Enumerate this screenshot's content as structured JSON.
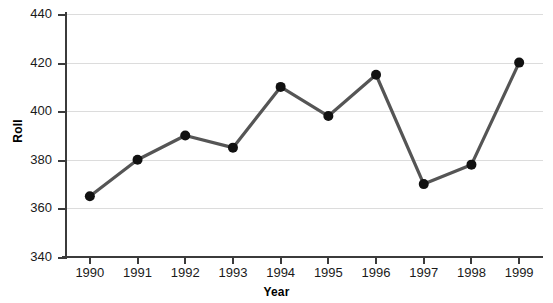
{
  "chart_data": {
    "type": "line",
    "title": "",
    "xlabel": "Year",
    "ylabel": "Roll",
    "categories": [
      "1990",
      "1991",
      "1992",
      "1993",
      "1994",
      "1995",
      "1996",
      "1997",
      "1998",
      "1999"
    ],
    "values": [
      365,
      380,
      390,
      385,
      410,
      398,
      415,
      370,
      378,
      420
    ],
    "series": [
      {
        "name": "Roll",
        "values": [
          365,
          380,
          390,
          385,
          410,
          398,
          415,
          370,
          378,
          420
        ]
      }
    ],
    "ylim": [
      340,
      440
    ],
    "yticks": [
      "340",
      "360",
      "380",
      "400",
      "420",
      "440"
    ],
    "ytick_values": [
      340,
      360,
      380,
      400,
      420,
      440
    ],
    "grid": true,
    "legend": false,
    "legend_position": "none",
    "line_color": "#555555",
    "marker_color": "#111111",
    "grid_color": "#dcdcdc",
    "axis_color": "#3b3b3b",
    "background_color": "#ffffff"
  }
}
